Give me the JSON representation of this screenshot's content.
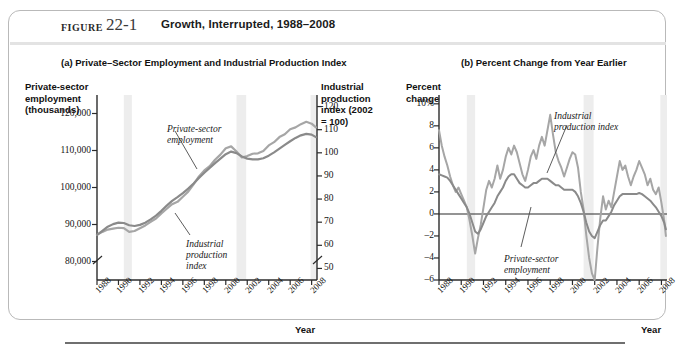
{
  "header": {
    "figure_word": "FIGURE",
    "figure_number": "22-1",
    "title": "Growth, Interrupted, 1988–2008"
  },
  "panel_a": {
    "title": "(a) Private–Sector Employment and Industrial Production Index",
    "left_axis_title": "Private-sector\nemployment\n(thousands)",
    "left_axis_line1": "Private-sector",
    "left_axis_line2": "employment",
    "left_axis_line3": "(thousands)",
    "right_axis_line1": "Industrial",
    "right_axis_line2": "production",
    "right_axis_line3": "index (2002",
    "right_axis_line4": "= 100)",
    "x_axis_title": "Year",
    "annotation_employment_line1": "Private-sector",
    "annotation_employment_line2": "employment",
    "annotation_ipi_line1": "Industrial",
    "annotation_ipi_line2": "production",
    "annotation_ipi_line3": "index"
  },
  "panel_b": {
    "title": "(b) Percent Change from Year Earlier",
    "left_axis_line1": "Percent",
    "left_axis_line2": "change",
    "x_axis_title": "Year",
    "annotation_ipi_line1": "Industrial",
    "annotation_ipi_line2": "production index",
    "annotation_employment_line1": "Private-sector",
    "annotation_employment_line2": "employment"
  },
  "colors": {
    "employment_line": "#8a8a8a",
    "ipi_line": "#a6a6a6",
    "recession_band": "#ededed",
    "axis": "#2b2b2b",
    "card_border": "#b9b9b9"
  },
  "chart_data": [
    {
      "type": "line",
      "panel": "a",
      "title": "(a) Private–Sector Employment and Industrial Production Index",
      "xlabel": "Year",
      "ylabel": "Private-sector employment (thousands)",
      "y2label": "Industrial production index (2002 = 100)",
      "xlim": [
        1988,
        2008.5
      ],
      "ylim": [
        75000,
        125000
      ],
      "y2lim": [
        45,
        125
      ],
      "grid": false,
      "legend": "annotations",
      "yticks": [
        80000,
        90000,
        100000,
        110000,
        120000
      ],
      "ytick_labels": [
        "80,000",
        "90,000",
        "100,000",
        "110,000",
        "120,000"
      ],
      "y2ticks": [
        50,
        60,
        70,
        80,
        90,
        100,
        110,
        120
      ],
      "y2tick_labels": [
        "50",
        "60",
        "70",
        "80",
        "90",
        "100",
        "110",
        "120"
      ],
      "xticks": [
        1988,
        1990,
        1992,
        1994,
        1996,
        1998,
        2000,
        2002,
        2004,
        2006,
        2008
      ],
      "xtick_labels": [
        "1988",
        "1990",
        "1992",
        "1994",
        "1996",
        "1998",
        "2000",
        "2002",
        "2004",
        "2006",
        "2008"
      ],
      "axis_break_y": true,
      "recession_bands": [
        [
          1990.5,
          1991.25
        ],
        [
          2001.0,
          2001.9
        ],
        [
          2007.9,
          2008.5
        ]
      ],
      "series": [
        {
          "name": "Private-sector employment",
          "axis": "left",
          "x": [
            1988.0,
            1988.5,
            1989.0,
            1989.5,
            1990.0,
            1990.5,
            1991.0,
            1991.5,
            1992.0,
            1992.5,
            1993.0,
            1993.5,
            1994.0,
            1994.5,
            1995.0,
            1995.5,
            1996.0,
            1996.5,
            1997.0,
            1997.5,
            1998.0,
            1998.5,
            1999.0,
            1999.5,
            2000.0,
            2000.5,
            2001.0,
            2001.5,
            2002.0,
            2002.5,
            2003.0,
            2003.5,
            2004.0,
            2004.5,
            2005.0,
            2005.5,
            2006.0,
            2006.5,
            2007.0,
            2007.5,
            2008.0,
            2008.4
          ],
          "values": [
            87200,
            88300,
            89400,
            90100,
            90500,
            90400,
            89800,
            89600,
            89900,
            90500,
            91400,
            92400,
            93700,
            95100,
            96400,
            97400,
            98500,
            99700,
            101100,
            102600,
            104000,
            105300,
            106600,
            107800,
            109000,
            109700,
            109300,
            108400,
            107800,
            107600,
            107600,
            107900,
            108600,
            109500,
            110500,
            111500,
            112500,
            113400,
            114100,
            114500,
            114300,
            113600
          ]
        },
        {
          "name": "Industrial production index",
          "axis": "right",
          "x": [
            1988.0,
            1988.5,
            1989.0,
            1989.5,
            1990.0,
            1990.5,
            1991.0,
            1991.5,
            1992.0,
            1992.5,
            1993.0,
            1993.5,
            1994.0,
            1994.5,
            1995.0,
            1995.5,
            1996.0,
            1996.5,
            1997.0,
            1997.5,
            1998.0,
            1998.5,
            1999.0,
            1999.5,
            2000.0,
            2000.5,
            2001.0,
            2001.5,
            2002.0,
            2002.5,
            2003.0,
            2003.5,
            2004.0,
            2004.5,
            2005.0,
            2005.5,
            2006.0,
            2006.5,
            2007.0,
            2007.5,
            2008.0,
            2008.4
          ],
          "values": [
            64.5,
            65.8,
            66.8,
            67.2,
            67.6,
            67.4,
            65.8,
            66.2,
            67.4,
            68.6,
            70.2,
            71.6,
            73.8,
            75.8,
            77.8,
            78.8,
            81.0,
            83.2,
            86.4,
            89.8,
            92.4,
            94.2,
            97.0,
            99.2,
            102.0,
            102.8,
            100.6,
            98.0,
            98.6,
            99.6,
            99.8,
            100.8,
            103.2,
            104.6,
            106.8,
            108.0,
            110.2,
            111.0,
            112.4,
            113.4,
            112.6,
            111.0
          ]
        }
      ]
    },
    {
      "type": "line",
      "panel": "b",
      "title": "(b) Percent Change from Year Earlier",
      "xlabel": "Year",
      "ylabel": "Percent change",
      "xlim": [
        1988,
        2008.5
      ],
      "ylim": [
        -6,
        10.8
      ],
      "grid": false,
      "legend": "annotations",
      "yticks": [
        -6,
        -4,
        -2,
        0,
        2,
        4,
        6,
        8,
        10
      ],
      "ytick_labels": [
        "–6",
        "–4",
        "–2",
        "0",
        "2",
        "4",
        "6",
        "8",
        "10%"
      ],
      "xticks": [
        1988,
        1990,
        1992,
        1994,
        1996,
        1998,
        2000,
        2002,
        2004,
        2006,
        2008
      ],
      "xtick_labels": [
        "1988",
        "1990",
        "1992",
        "1994",
        "1996",
        "1998",
        "2000",
        "2002",
        "2004",
        "2006",
        "2008"
      ],
      "zero_line": true,
      "recession_bands": [
        [
          1990.5,
          1991.25
        ],
        [
          2001.0,
          2001.9
        ],
        [
          2007.9,
          2008.5
        ]
      ],
      "series": [
        {
          "name": "Industrial production index",
          "x": [
            1988.0,
            1988.25,
            1988.5,
            1988.75,
            1989.0,
            1989.25,
            1989.5,
            1989.75,
            1990.0,
            1990.25,
            1990.5,
            1990.75,
            1991.0,
            1991.25,
            1991.5,
            1991.75,
            1992.0,
            1992.25,
            1992.5,
            1992.75,
            1993.0,
            1993.25,
            1993.5,
            1993.75,
            1994.0,
            1994.25,
            1994.5,
            1994.75,
            1995.0,
            1995.25,
            1995.5,
            1995.75,
            1996.0,
            1996.25,
            1996.5,
            1996.75,
            1997.0,
            1997.25,
            1997.5,
            1997.75,
            1998.0,
            1998.25,
            1998.5,
            1998.75,
            1999.0,
            1999.25,
            1999.5,
            1999.75,
            2000.0,
            2000.25,
            2000.5,
            2000.75,
            2001.0,
            2001.25,
            2001.5,
            2001.75,
            2002.0,
            2002.25,
            2002.5,
            2002.75,
            2003.0,
            2003.25,
            2003.5,
            2003.75,
            2004.0,
            2004.25,
            2004.5,
            2004.75,
            2005.0,
            2005.25,
            2005.5,
            2005.75,
            2006.0,
            2006.25,
            2006.5,
            2006.75,
            2007.0,
            2007.25,
            2007.5,
            2007.75,
            2008.0,
            2008.25,
            2008.4
          ],
          "values": [
            7.6,
            6.2,
            5.2,
            4.4,
            3.4,
            2.6,
            2.0,
            2.4,
            1.8,
            1.2,
            0.6,
            -0.6,
            -2.0,
            -3.6,
            -2.2,
            -1.0,
            0.6,
            2.2,
            3.0,
            2.4,
            3.2,
            4.4,
            3.2,
            4.0,
            5.2,
            6.0,
            5.4,
            6.2,
            5.6,
            4.6,
            3.6,
            3.0,
            4.0,
            5.2,
            5.8,
            5.0,
            6.2,
            7.0,
            6.2,
            7.6,
            9.0,
            7.2,
            5.6,
            4.8,
            4.2,
            3.4,
            4.2,
            5.0,
            5.6,
            5.4,
            4.2,
            2.0,
            0.4,
            -2.0,
            -4.0,
            -5.4,
            -6.0,
            -3.0,
            -0.4,
            1.6,
            0.4,
            1.2,
            0.6,
            2.0,
            3.4,
            4.8,
            4.0,
            4.4,
            3.4,
            2.6,
            3.4,
            4.0,
            4.8,
            4.2,
            3.6,
            2.6,
            3.2,
            2.2,
            1.8,
            2.4,
            1.0,
            -0.6,
            -2.0
          ]
        },
        {
          "name": "Private-sector employment",
          "x": [
            1988.0,
            1988.25,
            1988.5,
            1988.75,
            1989.0,
            1989.25,
            1989.5,
            1989.75,
            1990.0,
            1990.25,
            1990.5,
            1990.75,
            1991.0,
            1991.25,
            1991.5,
            1991.75,
            1992.0,
            1992.25,
            1992.5,
            1992.75,
            1993.0,
            1993.25,
            1993.5,
            1993.75,
            1994.0,
            1994.25,
            1994.5,
            1994.75,
            1995.0,
            1995.25,
            1995.5,
            1995.75,
            1996.0,
            1996.25,
            1996.5,
            1996.75,
            1997.0,
            1997.25,
            1997.5,
            1997.75,
            1998.0,
            1998.25,
            1998.5,
            1998.75,
            1999.0,
            1999.25,
            1999.5,
            1999.75,
            2000.0,
            2000.25,
            2000.5,
            2000.75,
            2001.0,
            2001.25,
            2001.5,
            2001.75,
            2002.0,
            2002.25,
            2002.5,
            2002.75,
            2003.0,
            2003.25,
            2003.5,
            2003.75,
            2004.0,
            2004.25,
            2004.5,
            2004.75,
            2005.0,
            2005.25,
            2005.5,
            2005.75,
            2006.0,
            2006.25,
            2006.5,
            2006.75,
            2007.0,
            2007.25,
            2007.5,
            2007.75,
            2008.0,
            2008.25,
            2008.4
          ],
          "values": [
            3.6,
            3.5,
            3.4,
            3.3,
            3.0,
            2.6,
            2.2,
            1.8,
            1.4,
            1.0,
            0.6,
            0.0,
            -0.8,
            -1.6,
            -1.8,
            -1.4,
            -0.8,
            -0.2,
            0.2,
            0.6,
            1.0,
            1.6,
            2.0,
            2.4,
            3.0,
            3.4,
            3.6,
            3.6,
            3.2,
            2.8,
            2.6,
            2.4,
            2.4,
            2.6,
            2.8,
            2.8,
            3.0,
            3.2,
            3.2,
            3.2,
            3.0,
            2.8,
            2.6,
            2.6,
            2.4,
            2.2,
            2.2,
            2.2,
            2.2,
            2.0,
            1.6,
            1.0,
            0.2,
            -0.8,
            -1.6,
            -2.0,
            -2.2,
            -1.6,
            -1.0,
            -0.6,
            -0.6,
            -0.2,
            0.2,
            0.8,
            1.2,
            1.6,
            1.8,
            1.8,
            1.8,
            1.8,
            1.8,
            1.8,
            1.9,
            1.8,
            1.6,
            1.4,
            1.2,
            0.9,
            0.6,
            0.2,
            -0.2,
            -0.8,
            -1.4
          ]
        }
      ]
    }
  ]
}
